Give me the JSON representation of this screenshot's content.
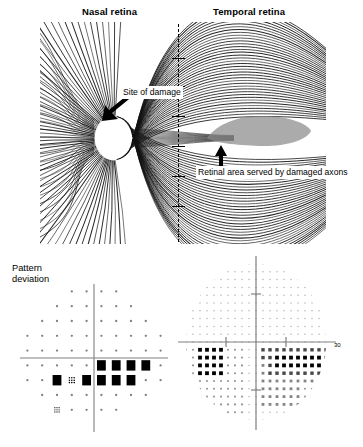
{
  "figure": {
    "panels": [
      "retinal-nerve-fibre-diagram",
      "pattern-deviation-plot",
      "greyscale-visual-field"
    ]
  },
  "top_panel": {
    "header_nasal": "Nasal retina",
    "header_temporal": "Temporal retina",
    "label_site_of_damage": "Site of damage",
    "label_retinal_area": "Retinal area\nserved by\ndamaged axons",
    "optic_disc_name": "optic-disc",
    "midline_style": "dashed",
    "shade_color": "#8a8a8a",
    "fibre_color": "#111111"
  },
  "pattern_deviation": {
    "label": "Pattern\ndeviation",
    "axis_color": "#808080",
    "symbol_levels": {
      "normal": "small faint dot",
      "p5": "light stipple",
      "p2": "medium stipple",
      "p1": "dark stipple",
      "p05": "solid black square"
    }
  },
  "greyscale_field": {
    "axis_label_right": "30",
    "axis_color": "#808080",
    "blind_spot_label": "physiologic-blind-spot",
    "scotoma_label": "arcuate-scotoma"
  },
  "chart_data": [
    {
      "type": "heatmap",
      "name": "pattern-deviation",
      "title": "Pattern deviation",
      "xlabel": "",
      "ylabel": "",
      "grid": false,
      "legend": "none",
      "notes": "Humphrey 30-2 pattern deviation probability plot, right eye. Columns are nasal (left) to temporal (right); rows superior (top) to inferior (bottom). Value 0 = normal faint dot, 1..3 = increasing stipple density, 4 = solid black square (p<0.5%).",
      "xlim": [
        -30,
        30
      ],
      "ylim": [
        -30,
        30
      ],
      "rows": [
        {
          "y": 27,
          "cells": [
            {
              "x": -9,
              "v": 0
            },
            {
              "x": -3,
              "v": 0
            },
            {
              "x": 3,
              "v": 0
            },
            {
              "x": 9,
              "v": 0
            }
          ]
        },
        {
          "y": 21,
          "cells": [
            {
              "x": -15,
              "v": 0
            },
            {
              "x": -9,
              "v": 0
            },
            {
              "x": -3,
              "v": 0
            },
            {
              "x": 3,
              "v": 0
            },
            {
              "x": 9,
              "v": 0
            },
            {
              "x": 15,
              "v": 0
            }
          ]
        },
        {
          "y": 15,
          "cells": [
            {
              "x": -21,
              "v": 0
            },
            {
              "x": -15,
              "v": 0
            },
            {
              "x": -9,
              "v": 0
            },
            {
              "x": -3,
              "v": 0
            },
            {
              "x": 3,
              "v": 0
            },
            {
              "x": 9,
              "v": 0
            },
            {
              "x": 15,
              "v": 0
            },
            {
              "x": 21,
              "v": 0
            }
          ]
        },
        {
          "y": 9,
          "cells": [
            {
              "x": -27,
              "v": 0
            },
            {
              "x": -21,
              "v": 0
            },
            {
              "x": -15,
              "v": 0
            },
            {
              "x": -9,
              "v": 0
            },
            {
              "x": -3,
              "v": 0
            },
            {
              "x": 3,
              "v": 0
            },
            {
              "x": 9,
              "v": 0
            },
            {
              "x": 15,
              "v": 0
            },
            {
              "x": 21,
              "v": 0
            },
            {
              "x": 27,
              "v": 0
            }
          ]
        },
        {
          "y": 3,
          "cells": [
            {
              "x": -27,
              "v": 0
            },
            {
              "x": -21,
              "v": 0
            },
            {
              "x": -15,
              "v": 0
            },
            {
              "x": -9,
              "v": 0
            },
            {
              "x": -3,
              "v": 0
            },
            {
              "x": 3,
              "v": 0
            },
            {
              "x": 9,
              "v": 0
            },
            {
              "x": 15,
              "v": 0
            },
            {
              "x": 21,
              "v": 0
            },
            {
              "x": 27,
              "v": 0
            }
          ]
        },
        {
          "y": -3,
          "cells": [
            {
              "x": -27,
              "v": 0
            },
            {
              "x": -21,
              "v": 0
            },
            {
              "x": -15,
              "v": 0
            },
            {
              "x": -9,
              "v": 0
            },
            {
              "x": -3,
              "v": 0
            },
            {
              "x": 3,
              "v": 4
            },
            {
              "x": 9,
              "v": 4
            },
            {
              "x": 15,
              "v": 4
            },
            {
              "x": 21,
              "v": 4
            },
            {
              "x": 27,
              "v": 0
            }
          ]
        },
        {
          "y": -9,
          "cells": [
            {
              "x": -27,
              "v": 0
            },
            {
              "x": -21,
              "v": 0
            },
            {
              "x": -15,
              "v": 4
            },
            {
              "x": -9,
              "v": 2
            },
            {
              "x": -3,
              "v": 4
            },
            {
              "x": 3,
              "v": 4
            },
            {
              "x": 9,
              "v": 4
            },
            {
              "x": 15,
              "v": 4
            },
            {
              "x": 21,
              "v": 0
            },
            {
              "x": 27,
              "v": 0
            }
          ]
        },
        {
          "y": -15,
          "cells": [
            {
              "x": -21,
              "v": 0
            },
            {
              "x": -15,
              "v": 0
            },
            {
              "x": -9,
              "v": 0
            },
            {
              "x": -3,
              "v": 0
            },
            {
              "x": 3,
              "v": 0
            },
            {
              "x": 9,
              "v": 0
            },
            {
              "x": 15,
              "v": 0
            },
            {
              "x": 21,
              "v": 0
            }
          ]
        },
        {
          "y": -21,
          "cells": [
            {
              "x": -15,
              "v": 1
            },
            {
              "x": -9,
              "v": 0
            },
            {
              "x": -3,
              "v": 0
            },
            {
              "x": 3,
              "v": 0
            },
            {
              "x": 9,
              "v": 0
            }
          ]
        }
      ]
    },
    {
      "type": "heatmap",
      "name": "greyscale-visual-field",
      "title": "",
      "xlabel": "",
      "ylabel": "",
      "grid": false,
      "legend": "none",
      "axis_tick_label": "30",
      "notes": "Greyscale representation of the same 30-2 field. Darkness encodes depth of sensitivity loss: 0 = normal stipple, 4 = dense black. A dense arcuate scotoma occupies the inferior temporal field reaching the temporal edge; the physiologic blind spot sits inferonasally.",
      "xlim": [
        -30,
        30
      ],
      "ylim": [
        -30,
        30
      ],
      "regions": [
        {
          "label": "superior-field",
          "density": 0,
          "bbox": [
            -30,
            2,
            30,
            30
          ]
        },
        {
          "label": "inferior-nasal-field",
          "density": 1,
          "bbox": [
            -30,
            -30,
            -4,
            -2
          ]
        },
        {
          "label": "physiologic-blind-spot",
          "density": 4,
          "bbox": [
            -24,
            -12,
            -14,
            -2
          ]
        },
        {
          "label": "arcuate-scotoma-core",
          "density": 4,
          "bbox": [
            6,
            -12,
            30,
            -2
          ]
        },
        {
          "label": "arcuate-scotoma-penumbra",
          "density": 3,
          "bbox": [
            2,
            -22,
            28,
            -2
          ]
        },
        {
          "label": "inferior-paracentral",
          "density": 2,
          "bbox": [
            2,
            -26,
            18,
            -12
          ]
        }
      ]
    }
  ]
}
